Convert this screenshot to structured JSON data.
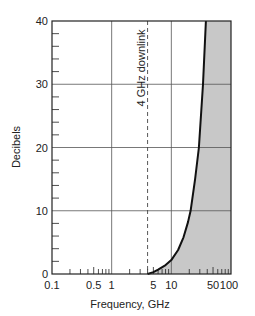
{
  "chart_data": {
    "type": "line",
    "title": "",
    "xlabel": "Frequency, GHz",
    "ylabel": "Decibels",
    "xscale": "log",
    "xlim": [
      0.1,
      100
    ],
    "ylim": [
      0,
      40
    ],
    "x_tick_labels": [
      "0.1",
      "0.5",
      "1",
      "5",
      "10",
      "50",
      "100"
    ],
    "x_tick_values": [
      0.1,
      0.5,
      1,
      5,
      10,
      50,
      100
    ],
    "y_tick_labels": [
      "0",
      "10",
      "20",
      "30",
      "40"
    ],
    "y_tick_values": [
      0,
      10,
      20,
      30,
      40
    ],
    "grid": true,
    "legend": null,
    "series": [
      {
        "name": "attenuation",
        "x": [
          4,
          5,
          6,
          8,
          10,
          13,
          16,
          19,
          21,
          25,
          29,
          34,
          38
        ],
        "y": [
          0,
          0.3,
          0.7,
          1.4,
          2.2,
          3.8,
          5.8,
          8.2,
          10,
          15,
          20,
          30,
          40
        ]
      }
    ],
    "shaded_region": {
      "description": "area to the right of the curve, shaded gray",
      "color": "#c8c8c8"
    },
    "annotations": [
      {
        "text": "4 GHz downlink",
        "x": 4,
        "style": "dashed vertical line, rotated label"
      }
    ],
    "colors": {
      "curve": "#111111",
      "shade": "#c8c8c8",
      "grid": "#555555",
      "frame": "#222222"
    }
  }
}
